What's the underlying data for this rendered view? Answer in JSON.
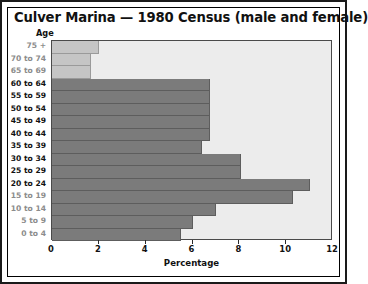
{
  "chart_data": {
    "type": "bar",
    "orientation": "horizontal",
    "title": "Culver Marina — 1980 Census (male and female)",
    "xlabel": "Percentage",
    "ylabel": "Age",
    "xlim": [
      0,
      12
    ],
    "xticks": [
      0,
      2,
      4,
      6,
      8,
      10,
      12
    ],
    "xtick_labels": [
      "0",
      "2",
      "4",
      "6",
      "8",
      "10",
      "12"
    ],
    "grid": false,
    "legend": "none",
    "categories": [
      "75 +",
      "70 to 74",
      "65 to 69",
      "60 to 64",
      "55 to 59",
      "50 to 54",
      "45 to 49",
      "40 to 44",
      "35 to 39",
      "30 to 34",
      "25 to 29",
      "20 to 24",
      "15 to 19",
      "10 to 14",
      "5 to 9",
      "0 to 4"
    ],
    "values": [
      2.0,
      1.65,
      1.65,
      6.75,
      6.75,
      6.75,
      6.75,
      6.75,
      6.4,
      8.05,
      8.05,
      11.0,
      10.3,
      7.0,
      6.0,
      5.5
    ],
    "bar_shades": [
      "light",
      "light",
      "light",
      "dark",
      "dark",
      "dark",
      "dark",
      "dark",
      "dark",
      "dark",
      "dark",
      "dark",
      "dark",
      "dark",
      "dark",
      "dark"
    ],
    "colors": {
      "bar_dark": "#7b7b7b",
      "bar_light": "#c5c5c5",
      "plot_background": "#ececec",
      "axis": "#4a4a4a",
      "text": "#111111",
      "muted_text": "#8c8c8c",
      "frame": "#1a1a1a"
    },
    "muted_label_indices": [
      0,
      1,
      2,
      12,
      13,
      14,
      15
    ]
  }
}
